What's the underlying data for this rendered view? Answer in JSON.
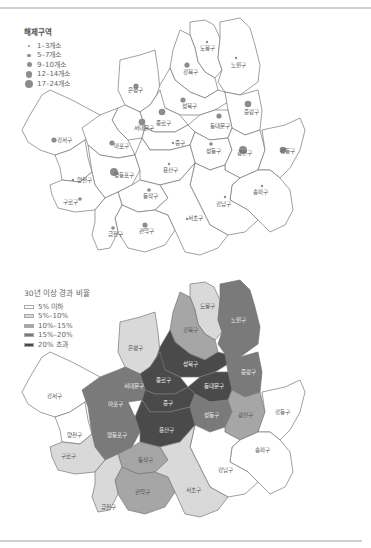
{
  "map1": {
    "legend": {
      "title": "해제구역",
      "items": [
        {
          "label": "1–3개소",
          "size": 2
        },
        {
          "label": "5–7개소",
          "size": 3.5
        },
        {
          "label": "9–10개소",
          "size": 5
        },
        {
          "label": "12–14개소",
          "size": 6.5
        },
        {
          "label": "17–24개소",
          "size": 8
        }
      ]
    },
    "districts": [
      {
        "name": "도봉구",
        "class": 1
      },
      {
        "name": "노원구",
        "class": 1
      },
      {
        "name": "강북구",
        "class": 3
      },
      {
        "name": "은평구",
        "class": 3
      },
      {
        "name": "성북구",
        "class": 3
      },
      {
        "name": "종로구",
        "class": 4
      },
      {
        "name": "중랑구",
        "class": 4
      },
      {
        "name": "서대문구",
        "class": 4
      },
      {
        "name": "동대문구",
        "class": 3
      },
      {
        "name": "강서구",
        "class": 3
      },
      {
        "name": "마포구",
        "class": 3
      },
      {
        "name": "중구",
        "class": 1
      },
      {
        "name": "성동구",
        "class": 2
      },
      {
        "name": "광진구",
        "class": 5
      },
      {
        "name": "강동구",
        "class": 4
      },
      {
        "name": "양천구",
        "class": 1
      },
      {
        "name": "영등포구",
        "class": 5
      },
      {
        "name": "용산구",
        "class": 1
      },
      {
        "name": "구로구",
        "class": 2
      },
      {
        "name": "동작구",
        "class": 2
      },
      {
        "name": "송파구",
        "class": 1
      },
      {
        "name": "강남구",
        "class": 1
      },
      {
        "name": "관악구",
        "class": 3
      },
      {
        "name": "금천구",
        "class": 2
      },
      {
        "name": "서초구",
        "class": 1
      }
    ]
  },
  "map2": {
    "legend": {
      "title": "30년 이상 경과 비율",
      "items": [
        {
          "label": "5% 이하",
          "color": "#ffffff"
        },
        {
          "label": "5%–10%",
          "color": "#d9d9d9"
        },
        {
          "label": "10%–15%",
          "color": "#a6a6a6"
        },
        {
          "label": "15%–20%",
          "color": "#7a7a7a"
        },
        {
          "label": "20% 초과",
          "color": "#4a4a4a"
        }
      ]
    },
    "districts": [
      {
        "name": "도봉구",
        "class": 2
      },
      {
        "name": "노원구",
        "class": 4
      },
      {
        "name": "강북구",
        "class": 3
      },
      {
        "name": "은평구",
        "class": 2
      },
      {
        "name": "성북구",
        "class": 5
      },
      {
        "name": "종로구",
        "class": 5
      },
      {
        "name": "중랑구",
        "class": 4
      },
      {
        "name": "서대문구",
        "class": 4
      },
      {
        "name": "동대문구",
        "class": 5
      },
      {
        "name": "강서구",
        "class": 1
      },
      {
        "name": "마포구",
        "class": 4
      },
      {
        "name": "중구",
        "class": 5
      },
      {
        "name": "성동구",
        "class": 4
      },
      {
        "name": "광진구",
        "class": 3
      },
      {
        "name": "강동구",
        "class": 1
      },
      {
        "name": "양천구",
        "class": 1
      },
      {
        "name": "영등포구",
        "class": 4
      },
      {
        "name": "용산구",
        "class": 5
      },
      {
        "name": "구로구",
        "class": 2
      },
      {
        "name": "동작구",
        "class": 3
      },
      {
        "name": "송파구",
        "class": 1
      },
      {
        "name": "강남구",
        "class": 1
      },
      {
        "name": "관악구",
        "class": 3
      },
      {
        "name": "금천구",
        "class": 2
      },
      {
        "name": "서초구",
        "class": 2
      }
    ]
  }
}
